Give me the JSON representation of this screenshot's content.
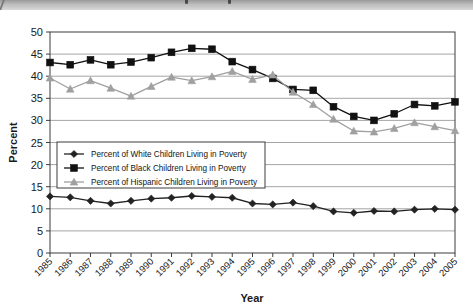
{
  "page": {
    "background_color": "#ffffff",
    "banner_color": "#bdbdbd"
  },
  "chart_data": {
    "type": "line",
    "title": "",
    "xlabel": "Year",
    "ylabel": "Percent",
    "ylim": [
      0,
      50
    ],
    "ytick_step": 5,
    "yticks": [
      "0",
      "5",
      "10",
      "15",
      "20",
      "25",
      "30",
      "35",
      "40",
      "45",
      "50"
    ],
    "grid": true,
    "grid_axis": "y",
    "legend_position": "inside-left-middle",
    "categories": [
      "1985",
      "1986",
      "1987",
      "1988",
      "1989",
      "1990",
      "1991",
      "1992",
      "1993",
      "1994",
      "1995",
      "1996",
      "1997",
      "1998",
      "1999",
      "2000",
      "2001",
      "2002",
      "2003",
      "2004",
      "2005"
    ],
    "series": [
      {
        "name": "Percent of White Children Living in Poverty",
        "marker": "diamond",
        "color": "#222222",
        "values": [
          12.8,
          12.6,
          11.8,
          11.2,
          11.8,
          12.3,
          12.5,
          12.9,
          12.7,
          12.5,
          11.2,
          11.0,
          11.4,
          10.6,
          9.4,
          9.1,
          9.5,
          9.4,
          9.8,
          10.0,
          9.8
        ]
      },
      {
        "name": "Percent of Black Children Living in Poverty",
        "marker": "square",
        "color": "#111111",
        "values": [
          43.1,
          42.6,
          43.7,
          42.6,
          43.2,
          44.2,
          45.4,
          46.3,
          46.1,
          43.3,
          41.5,
          39.5,
          37.0,
          36.8,
          33.1,
          30.9,
          30.0,
          31.5,
          33.6,
          33.3,
          34.2
        ]
      },
      {
        "name": "Percent of Hispanic Children Living in Poverty",
        "marker": "triangle",
        "color": "#a0a0a0",
        "values": [
          39.6,
          37.1,
          39.0,
          37.3,
          35.5,
          37.7,
          39.8,
          39.0,
          39.9,
          41.1,
          39.3,
          40.3,
          36.4,
          33.6,
          30.3,
          27.6,
          27.4,
          28.2,
          29.5,
          28.6,
          27.7
        ]
      }
    ]
  }
}
